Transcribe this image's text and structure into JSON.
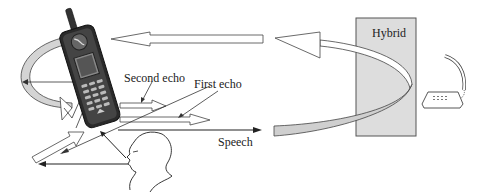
{
  "figure": {
    "labels": {
      "hybrid": "Hybrid",
      "second_echo": "Second echo",
      "first_echo": "First echo",
      "speech": "Speech"
    },
    "elements": [
      {
        "name": "mobile-phone",
        "description": "Handheld cellular phone, tilted"
      },
      {
        "name": "speaker-head",
        "description": "Profile outline of a person talking"
      },
      {
        "name": "hybrid-box",
        "description": "Grey rectangle labeled Hybrid"
      },
      {
        "name": "desk-telephone",
        "description": "Landline telephone with handset"
      },
      {
        "name": "hybrid-echo-loop",
        "description": "Curved band looping through the hybrid back toward the mobile"
      },
      {
        "name": "acoustic-echo-loop",
        "description": "Curved band looping around the mobile phone"
      }
    ],
    "colors": {
      "stroke": "#333333",
      "band_fill": "#d4d4d4",
      "hybrid_fill": "#dddddd",
      "background": "#ffffff"
    }
  }
}
